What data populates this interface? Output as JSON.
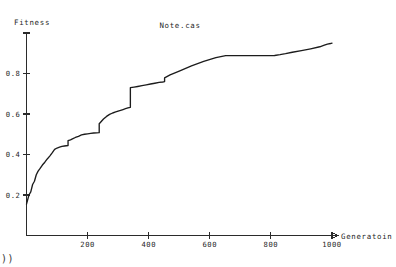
{
  "chart_data": {
    "type": "line",
    "title": "Note.cas",
    "xlabel": "Generatoin",
    "ylabel": "Fitness",
    "xlim": [
      0,
      1040
    ],
    "ylim": [
      0,
      1.04
    ],
    "grid": false,
    "legend": "none",
    "xticks": [
      200,
      400,
      600,
      800,
      1000
    ],
    "xtick_labels": [
      "200",
      "400",
      "600",
      "800",
      "1000"
    ],
    "yticks": [
      0.2,
      0.4,
      0.6,
      0.8,
      1.0
    ],
    "ytick_labels": [
      "0.2",
      "0.4",
      "0.6",
      "0.8",
      "1"
    ],
    "series": [
      {
        "name": "best fitness",
        "color": "#1c1c1c",
        "x": [
          0,
          8,
          14,
          20,
          26,
          32,
          38,
          44,
          52,
          60,
          68,
          76,
          84,
          92,
          100,
          108,
          116,
          124,
          130,
          136,
          136,
          144,
          152,
          160,
          170,
          180,
          190,
          200,
          210,
          220,
          230,
          238,
          238,
          244,
          252,
          262,
          272,
          282,
          292,
          300,
          308,
          316,
          324,
          332,
          340,
          340,
          352,
          364,
          378,
          392,
          406,
          420,
          434,
          446,
          452,
          452,
          470,
          500,
          540,
          580,
          620,
          652,
          652,
          680,
          710,
          740,
          770,
          800,
          812,
          812,
          830,
          848,
          870,
          900,
          930,
          960,
          975,
          975,
          985,
          995,
          1000
        ],
        "y": [
          0.155,
          0.2,
          0.215,
          0.252,
          0.268,
          0.3,
          0.318,
          0.33,
          0.348,
          0.362,
          0.378,
          0.392,
          0.408,
          0.425,
          0.432,
          0.436,
          0.44,
          0.442,
          0.443,
          0.444,
          0.468,
          0.472,
          0.478,
          0.484,
          0.49,
          0.497,
          0.5,
          0.502,
          0.504,
          0.506,
          0.507,
          0.508,
          0.552,
          0.562,
          0.575,
          0.588,
          0.598,
          0.605,
          0.61,
          0.614,
          0.618,
          0.622,
          0.626,
          0.63,
          0.633,
          0.73,
          0.733,
          0.736,
          0.74,
          0.744,
          0.748,
          0.752,
          0.756,
          0.758,
          0.76,
          0.778,
          0.793,
          0.812,
          0.838,
          0.86,
          0.878,
          0.888,
          0.888,
          0.888,
          0.888,
          0.888,
          0.888,
          0.888,
          0.889,
          0.889,
          0.893,
          0.898,
          0.905,
          0.913,
          0.922,
          0.932,
          0.94,
          0.94,
          0.945,
          0.948,
          0.95
        ],
        "description": "Monotonically increasing best-fitness curve with step-like plateaus; sharp vertical jump from 0.633 to 0.73 near generation 340, long plateau at 0.888 between generations 450 and 810, final rise to about 1.0 at generation 1000."
      }
    ],
    "annotations": {
      "corner_artifact": "))"
    }
  }
}
